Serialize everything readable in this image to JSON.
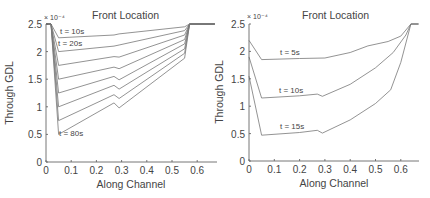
{
  "chart_data": [
    {
      "type": "line",
      "title": "Front Location",
      "xlabel": "Along Channel",
      "ylabel": "Through GDL",
      "y_multiplier": "× 10⁻⁴",
      "xlim": [
        0,
        0.67
      ],
      "ylim": [
        0,
        2.5
      ],
      "xticks": [
        "0",
        "0.1",
        "0.2",
        "0.3",
        "0.4",
        "0.5",
        "0.6"
      ],
      "yticks": [
        "0",
        "0.5",
        "1",
        "1.5",
        "2",
        "2.5"
      ],
      "grid": false,
      "annotations": [
        "t = 10s",
        "t = 20s",
        "t = 80s"
      ],
      "series": [
        {
          "name": "t = 10s",
          "x": [
            0,
            0.02,
            0.05,
            0.27,
            0.29,
            0.55,
            0.57,
            0.67
          ],
          "y": [
            2.5,
            2.5,
            2.25,
            2.3,
            2.32,
            2.45,
            2.5,
            2.5
          ]
        },
        {
          "name": "t = 20s",
          "x": [
            0,
            0.02,
            0.05,
            0.27,
            0.29,
            0.55,
            0.57,
            0.67
          ],
          "y": [
            2.5,
            2.5,
            2.0,
            2.1,
            2.12,
            2.38,
            2.5,
            2.5
          ]
        },
        {
          "name": "t = 30s",
          "x": [
            0,
            0.02,
            0.05,
            0.27,
            0.29,
            0.55,
            0.57,
            0.67
          ],
          "y": [
            2.5,
            2.5,
            1.75,
            1.91,
            1.9,
            2.3,
            2.5,
            2.5
          ]
        },
        {
          "name": "t = 40s",
          "x": [
            0,
            0.02,
            0.05,
            0.27,
            0.29,
            0.55,
            0.57,
            0.67
          ],
          "y": [
            2.5,
            2.5,
            1.5,
            1.72,
            1.69,
            2.22,
            2.5,
            2.5
          ]
        },
        {
          "name": "t = 50s",
          "x": [
            0,
            0.02,
            0.05,
            0.27,
            0.29,
            0.55,
            0.57,
            0.67
          ],
          "y": [
            2.5,
            2.5,
            1.25,
            1.55,
            1.49,
            2.14,
            2.5,
            2.5
          ]
        },
        {
          "name": "t = 60s",
          "x": [
            0,
            0.02,
            0.05,
            0.27,
            0.29,
            0.55,
            0.57,
            0.67
          ],
          "y": [
            2.5,
            2.5,
            1.0,
            1.39,
            1.32,
            2.05,
            2.5,
            2.5
          ]
        },
        {
          "name": "t = 70s",
          "x": [
            0,
            0.02,
            0.05,
            0.27,
            0.29,
            0.55,
            0.57,
            0.67
          ],
          "y": [
            2.5,
            2.5,
            0.75,
            1.22,
            1.15,
            1.97,
            2.5,
            2.5
          ]
        },
        {
          "name": "t = 80s",
          "x": [
            0,
            0.02,
            0.05,
            0.27,
            0.29,
            0.55,
            0.57,
            0.67
          ],
          "y": [
            2.5,
            2.5,
            0.5,
            1.07,
            0.98,
            1.88,
            2.5,
            2.5
          ]
        }
      ]
    },
    {
      "type": "line",
      "title": "Front Location",
      "xlabel": "Along Channel",
      "ylabel": "Through GDL",
      "y_multiplier": "× 10⁻⁴",
      "xlim": [
        0,
        0.67
      ],
      "ylim": [
        0,
        2.5
      ],
      "xticks": [
        "0",
        "0.1",
        "0.2",
        "0.3",
        "0.4",
        "0.5",
        "0.6"
      ],
      "yticks": [
        "0",
        "0.5",
        "1",
        "1.5",
        "2",
        "2.5"
      ],
      "grid": false,
      "annotations": [
        "t = 5s",
        "t = 10s",
        "t = 15s"
      ],
      "series": [
        {
          "name": "t = 5s",
          "x": [
            0,
            0.05,
            0.2,
            0.3,
            0.4,
            0.47,
            0.55,
            0.6,
            0.64,
            0.67
          ],
          "y": [
            2.2,
            1.85,
            1.87,
            1.88,
            1.98,
            2.1,
            2.18,
            2.28,
            2.5,
            2.5
          ]
        },
        {
          "name": "t = 10s",
          "x": [
            0,
            0.05,
            0.2,
            0.27,
            0.29,
            0.4,
            0.5,
            0.57,
            0.62,
            0.64,
            0.67
          ],
          "y": [
            1.9,
            1.15,
            1.19,
            1.22,
            1.18,
            1.4,
            1.7,
            1.98,
            2.3,
            2.5,
            2.5
          ]
        },
        {
          "name": "t = 15s",
          "x": [
            0,
            0.05,
            0.2,
            0.27,
            0.29,
            0.4,
            0.5,
            0.56,
            0.6,
            0.64,
            0.67
          ],
          "y": [
            1.55,
            0.47,
            0.52,
            0.56,
            0.51,
            0.75,
            1.05,
            1.3,
            1.8,
            2.5,
            2.5
          ]
        }
      ]
    }
  ],
  "left": {
    "title": "Front Location",
    "xlabel": "Along Channel",
    "ylabel": "Through GDL",
    "exp": "× 10⁻⁴",
    "labels": [
      "t = 10s",
      "t = 20s",
      "t = 80s"
    ]
  },
  "right": {
    "title": "Front Location",
    "xlabel": "Along Channel",
    "ylabel": "Through GDL",
    "exp": "× 10⁻⁴",
    "labels": [
      "t = 5s",
      "t = 10s",
      "t = 15s"
    ]
  }
}
